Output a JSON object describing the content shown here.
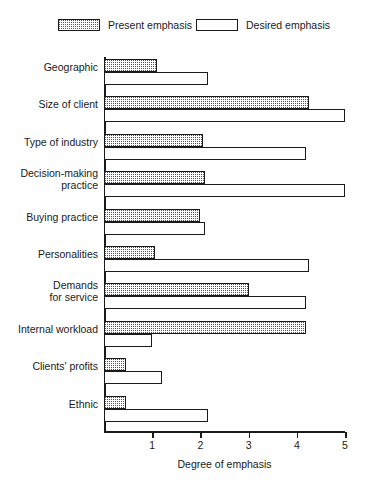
{
  "chart_data": {
    "type": "bar",
    "orientation": "horizontal",
    "title": "",
    "xlabel": "Degree of emphasis",
    "ylabel": "",
    "xlim": [
      0,
      5
    ],
    "xticks": [
      1,
      2,
      3,
      4,
      5
    ],
    "xtick_labels": [
      "1",
      "2",
      "3",
      "4",
      "5"
    ],
    "grid": false,
    "legend_position": "top",
    "categories": [
      "Geographic",
      "Size of client",
      "Type of industry",
      "Decision-making\npractice",
      "Buying practice",
      "Personalities",
      "Demands\nfor service",
      "Internal workload",
      "Clients' profits",
      "Ethnic"
    ],
    "series": [
      {
        "name": "Present emphasis",
        "fill": "stipple",
        "values": [
          1.1,
          4.25,
          2.05,
          2.1,
          2.0,
          1.05,
          3.0,
          4.2,
          0.45,
          0.45
        ]
      },
      {
        "name": "Desired emphasis",
        "fill": "empty",
        "values": [
          2.15,
          5.0,
          4.2,
          5.0,
          2.1,
          4.25,
          4.2,
          1.0,
          1.2,
          2.15
        ]
      }
    ]
  },
  "legend": {
    "entries": [
      {
        "label": "Present emphasis"
      },
      {
        "label": "Desired emphasis"
      }
    ]
  },
  "colors": {
    "ink": "#1a1a1a",
    "background": "#ffffff",
    "stipple": "#555555"
  }
}
